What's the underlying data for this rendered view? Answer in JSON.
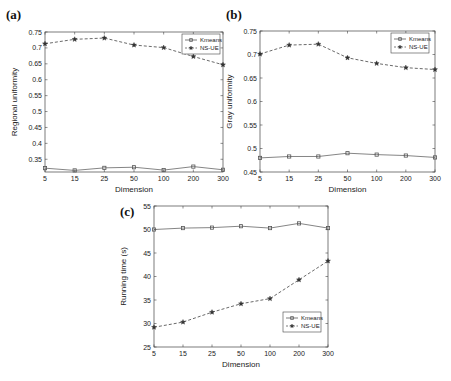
{
  "chart_data": [
    {
      "panel": "(a)",
      "type": "line",
      "title": "",
      "xlabel": "Dimension",
      "ylabel": "Regional uniformity",
      "categories": [
        "5",
        "15",
        "25",
        "50",
        "100",
        "200",
        "300"
      ],
      "ylim": [
        0.31,
        0.75
      ],
      "yticks": [
        "0.35",
        "0.4",
        "0.45",
        "0.5",
        "0.55",
        "0.6",
        "0.65",
        "0.7",
        "0.75"
      ],
      "grid": false,
      "legend_position": "top-right",
      "series": [
        {
          "name": "Kmeans",
          "marker": "square",
          "line": "solid",
          "values": [
            0.322,
            0.315,
            0.323,
            0.325,
            0.316,
            0.327,
            0.317
          ]
        },
        {
          "name": "NS-UE",
          "marker": "star",
          "line": "dashed",
          "values": [
            0.713,
            0.727,
            0.731,
            0.709,
            0.701,
            0.673,
            0.647
          ]
        }
      ]
    },
    {
      "panel": "(b)",
      "type": "line",
      "title": "",
      "xlabel": "Dimension",
      "ylabel": "Gray uniformity",
      "categories": [
        "5",
        "15",
        "25",
        "50",
        "100",
        "200",
        "300"
      ],
      "ylim": [
        0.45,
        0.75
      ],
      "yticks": [
        "0.45",
        "0.5",
        "0.55",
        "0.6",
        "0.65",
        "0.7",
        "0.75"
      ],
      "grid": false,
      "legend_position": "top-right",
      "series": [
        {
          "name": "Kmeans",
          "marker": "square",
          "line": "solid",
          "values": [
            0.48,
            0.483,
            0.483,
            0.49,
            0.487,
            0.485,
            0.481
          ]
        },
        {
          "name": "NS-UE",
          "marker": "star",
          "line": "dashed",
          "values": [
            0.701,
            0.72,
            0.722,
            0.693,
            0.681,
            0.672,
            0.668
          ]
        }
      ]
    },
    {
      "panel": "(c)",
      "type": "line",
      "title": "",
      "xlabel": "Dimension",
      "ylabel": "Running time (s)",
      "categories": [
        "5",
        "15",
        "25",
        "50",
        "100",
        "200",
        "300"
      ],
      "ylim": [
        25,
        55
      ],
      "yticks": [
        "25",
        "30",
        "35",
        "40",
        "45",
        "50",
        "55"
      ],
      "grid": false,
      "legend_position": "bottom-right",
      "series": [
        {
          "name": "Kmeans",
          "marker": "square",
          "line": "solid",
          "values": [
            50.0,
            50.3,
            50.4,
            50.7,
            50.3,
            51.3,
            50.3
          ]
        },
        {
          "name": "NS-UE",
          "marker": "star",
          "line": "dashed",
          "values": [
            29.2,
            30.3,
            32.4,
            34.2,
            35.3,
            39.3,
            43.3
          ]
        }
      ]
    }
  ]
}
